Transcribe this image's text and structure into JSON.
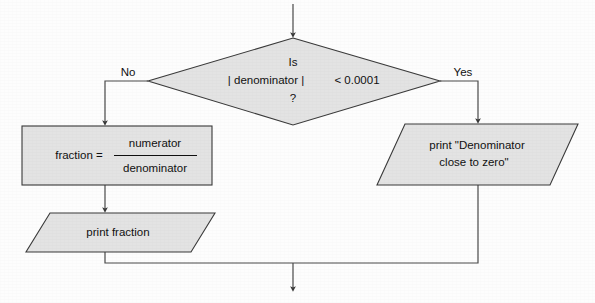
{
  "diagram": {
    "type": "flowchart",
    "colors": {
      "shape_fill": "#e3e3e3",
      "shape_stroke": "#3a3a3a",
      "connector": "#4a4a4a",
      "text": "#111111",
      "background": "#fdfdfd"
    },
    "decision": {
      "shape": "diamond",
      "line1": "Is",
      "line2_left": "| denominator |",
      "line2_right": "< 0.0001",
      "line3": "?"
    },
    "edges": {
      "no_label": "No",
      "yes_label": "Yes"
    },
    "process_assign": {
      "shape": "rectangle",
      "lhs": "fraction  =",
      "fraction_numerator": "numerator",
      "fraction_denominator": "denominator"
    },
    "output_fraction": {
      "shape": "parallelogram",
      "text": "print fraction"
    },
    "output_warning": {
      "shape": "parallelogram",
      "line1": "print  \"Denominator",
      "line2": "close to zero\""
    }
  }
}
